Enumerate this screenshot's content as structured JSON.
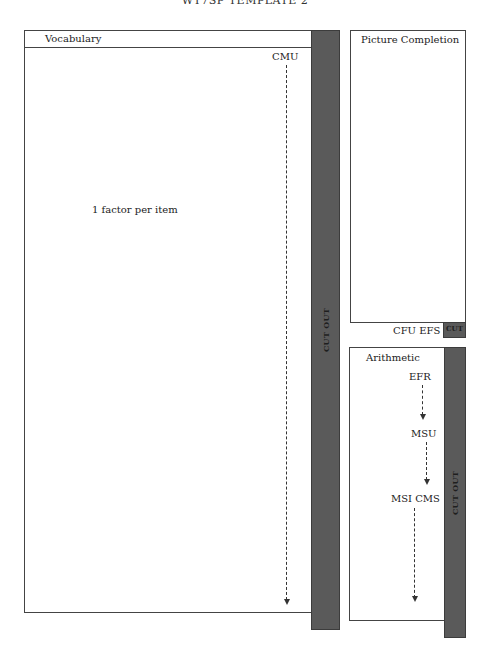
{
  "page": {
    "title": "WT7SP TEMPLATE 2"
  },
  "vocabulary": {
    "header": "Vocabulary",
    "factor_label": "CMU",
    "note": "1 factor per item",
    "cutout_label": "CUT OUT"
  },
  "picture_completion": {
    "header": "Picture Completion",
    "factor_labels": "CFU EFS",
    "cutout_label": "CUT"
  },
  "arithmetic": {
    "header": "Arithmetic",
    "nodes": [
      "EFR",
      "MSU",
      "MSI CMS"
    ],
    "cutout_label": "CUT OUT"
  },
  "colors": {
    "cutout_fill": "#5a5a5a",
    "border": "#444444",
    "background": "#ffffff"
  }
}
